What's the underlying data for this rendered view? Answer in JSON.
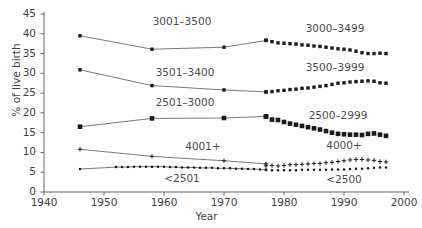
{
  "chart_data": {
    "type": "line",
    "title": "",
    "xlabel": "Year",
    "ylabel": "% of live birth",
    "xlim": [
      1940,
      2000
    ],
    "ylim": [
      0,
      45
    ],
    "grid": false,
    "legend_position": "inline-annotations",
    "xticks": [
      "1940",
      "1950",
      "1960",
      "1970",
      "1980",
      "1990",
      "2000"
    ],
    "xtick_values": [
      1940,
      1950,
      1960,
      1970,
      1980,
      1990,
      2000
    ],
    "yticks": [
      "0",
      "5",
      "10",
      "15",
      "20",
      "25",
      "30",
      "35",
      "40",
      "45"
    ],
    "ytick_values": [
      0,
      5,
      10,
      15,
      20,
      25,
      30,
      35,
      40,
      45
    ],
    "series": [
      {
        "name": "3001-3500",
        "label": "3001–3500",
        "marker": "square-small",
        "line": true,
        "x": [
          1946,
          1958,
          1970,
          1977
        ],
        "values": [
          39.5,
          36.1,
          36.6,
          38.3
        ]
      },
      {
        "name": "3000-3499",
        "label": "3000–3499",
        "marker": "square-small",
        "line": false,
        "x": [
          1977,
          1978,
          1979,
          1980,
          1981,
          1982,
          1983,
          1984,
          1985,
          1986,
          1987,
          1988,
          1989,
          1990,
          1991,
          1992,
          1993,
          1994,
          1995,
          1996,
          1997
        ],
        "values": [
          38.4,
          38.0,
          37.7,
          37.6,
          37.5,
          37.4,
          37.2,
          37.1,
          36.9,
          36.8,
          36.6,
          36.4,
          36.2,
          36.1,
          35.9,
          35.6,
          35.2,
          35.0,
          35.0,
          35.1,
          35.0
        ]
      },
      {
        "name": "3501-3400",
        "label": "3501–3400",
        "marker": "square-small",
        "line": true,
        "x": [
          1946,
          1958,
          1970,
          1977
        ],
        "values": [
          30.9,
          26.9,
          25.8,
          25.3
        ]
      },
      {
        "name": "3500-3999",
        "label": "3500–3999",
        "marker": "square-small",
        "line": false,
        "x": [
          1977,
          1978,
          1979,
          1980,
          1981,
          1982,
          1983,
          1984,
          1985,
          1986,
          1987,
          1988,
          1989,
          1990,
          1991,
          1992,
          1993,
          1994,
          1995,
          1996,
          1997
        ],
        "values": [
          25.3,
          25.4,
          25.6,
          25.7,
          25.9,
          26.0,
          26.2,
          26.3,
          26.5,
          26.7,
          26.9,
          27.2,
          27.5,
          27.6,
          27.8,
          27.9,
          28.0,
          28.1,
          28.0,
          27.6,
          27.5
        ]
      },
      {
        "name": "2501-3000",
        "label": "2501–3000",
        "marker": "square-large",
        "line": true,
        "x": [
          1946,
          1958,
          1970,
          1977
        ],
        "values": [
          16.5,
          18.6,
          18.7,
          19.1
        ]
      },
      {
        "name": "2500-2999",
        "label": "2500–2999",
        "marker": "square-large",
        "line": false,
        "x": [
          1977,
          1978,
          1979,
          1980,
          1981,
          1982,
          1983,
          1984,
          1985,
          1986,
          1987,
          1988,
          1989,
          1990,
          1991,
          1992,
          1993,
          1994,
          1995,
          1996,
          1997
        ],
        "values": [
          19.1,
          18.3,
          18.2,
          17.7,
          17.3,
          17.0,
          16.7,
          16.4,
          16.1,
          15.8,
          15.4,
          15.0,
          14.7,
          14.6,
          14.5,
          14.5,
          14.4,
          14.7,
          14.8,
          14.5,
          14.2
        ]
      },
      {
        "name": "4001+",
        "label": "4001+",
        "marker": "cross",
        "line": true,
        "x": [
          1946,
          1958,
          1970,
          1977
        ],
        "values": [
          10.8,
          9.0,
          7.9,
          7.1
        ]
      },
      {
        "name": "4000+",
        "label": "4000+",
        "marker": "cross",
        "line": false,
        "x": [
          1977,
          1978,
          1979,
          1980,
          1981,
          1982,
          1983,
          1984,
          1985,
          1986,
          1987,
          1988,
          1989,
          1990,
          1991,
          1992,
          1993,
          1994,
          1995,
          1996,
          1997
        ],
        "values": [
          6.6,
          6.7,
          6.6,
          6.7,
          6.9,
          6.9,
          7.0,
          7.1,
          7.2,
          7.2,
          7.4,
          7.5,
          7.7,
          7.9,
          8.1,
          8.2,
          8.2,
          8.1,
          8.0,
          7.7,
          7.6
        ]
      },
      {
        "name": "<2501",
        "label": "<2501",
        "marker": "dot",
        "line": true,
        "x": [
          1946,
          1952,
          1953,
          1954,
          1955,
          1956,
          1957,
          1958,
          1959,
          1960,
          1961,
          1962,
          1963,
          1964,
          1965,
          1966,
          1967,
          1968,
          1969,
          1970,
          1971,
          1972,
          1973,
          1974,
          1975,
          1976,
          1977
        ],
        "values": [
          5.8,
          6.3,
          6.3,
          6.3,
          6.4,
          6.4,
          6.4,
          6.4,
          6.4,
          6.4,
          6.3,
          6.3,
          6.2,
          6.2,
          6.2,
          6.1,
          6.1,
          6.1,
          6.0,
          6.0,
          6.0,
          5.9,
          5.9,
          5.8,
          5.8,
          5.7,
          5.7
        ]
      },
      {
        "name": "<2500",
        "label": "<2500",
        "marker": "dot",
        "line": false,
        "x": [
          1977,
          1978,
          1979,
          1980,
          1981,
          1982,
          1983,
          1984,
          1985,
          1986,
          1987,
          1988,
          1989,
          1990,
          1991,
          1992,
          1993,
          1994,
          1995,
          1996,
          1997
        ],
        "values": [
          5.5,
          5.5,
          5.5,
          5.5,
          5.5,
          5.5,
          5.6,
          5.6,
          5.6,
          5.6,
          5.6,
          5.7,
          5.7,
          5.7,
          5.8,
          5.9,
          5.9,
          6.0,
          6.1,
          6.2,
          6.2
        ]
      }
    ],
    "annotations": [
      {
        "text": "3001–3500",
        "x": 1963.0,
        "y": 43.0
      },
      {
        "text": "3000–3499",
        "x": 1988.5,
        "y": 41.2
      },
      {
        "text": "3501–3400",
        "x": 1963.5,
        "y": 30.2
      },
      {
        "text": "3500–3999",
        "x": 1988.5,
        "y": 31.3
      },
      {
        "text": "2501–3000",
        "x": 1963.5,
        "y": 22.5
      },
      {
        "text": "2500–2999",
        "x": 1989.0,
        "y": 19.3
      },
      {
        "text": "4001+",
        "x": 1966.5,
        "y": 11.3
      },
      {
        "text": "4000+",
        "x": 1990.0,
        "y": 11.6
      },
      {
        "text": "<2501",
        "x": 1963.0,
        "y": 3.3
      },
      {
        "text": "<2500",
        "x": 1990.0,
        "y": 3.1
      }
    ]
  },
  "axis": {
    "y_title": "% of live birth",
    "x_title": "Year"
  }
}
